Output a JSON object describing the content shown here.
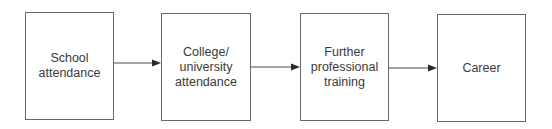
{
  "diagram": {
    "type": "flowchart",
    "direction": "left-to-right",
    "nodes": [
      {
        "id": "school",
        "label": "School\nattendance"
      },
      {
        "id": "college",
        "label": "College/\nuniversity\nattendance"
      },
      {
        "id": "training",
        "label": "Further\nprofessional\ntraining"
      },
      {
        "id": "career",
        "label": "Career"
      }
    ],
    "edges": [
      {
        "from": "school",
        "to": "college"
      },
      {
        "from": "college",
        "to": "training"
      },
      {
        "from": "training",
        "to": "career"
      }
    ],
    "colors": {
      "border": "#6a6a6a",
      "text": "#3a3a3a",
      "arrow": "#3a3a3a"
    }
  }
}
